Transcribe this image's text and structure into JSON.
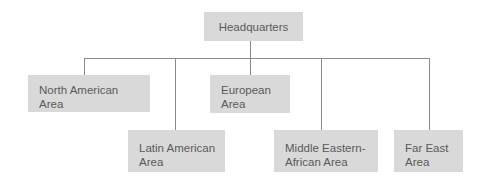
{
  "diagram": {
    "type": "org-chart",
    "root": {
      "label": "Headquarters"
    },
    "children": [
      {
        "label": "North American\nArea",
        "row": 1
      },
      {
        "label": "Latin American\nArea",
        "row": 2
      },
      {
        "label": "European\nArea",
        "row": 1
      },
      {
        "label": "Middle Eastern-\nAfrican Area",
        "row": 2
      },
      {
        "label": "Far East\nArea",
        "row": 2
      }
    ],
    "colors": {
      "box_fill": "#d9d9d9",
      "text": "#5a5a5a",
      "connector": "#8a8a8a",
      "background": "#ffffff"
    }
  }
}
